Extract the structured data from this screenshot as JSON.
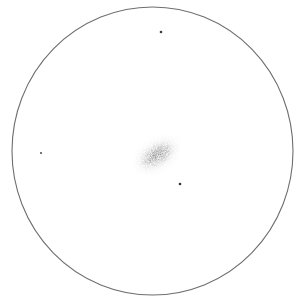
{
  "canvas": {
    "width": 299,
    "height": 301,
    "background": "#ffffff"
  },
  "field_of_view": {
    "cx": 152.5,
    "cy": 151,
    "rx": 140.5,
    "ry": 144,
    "stroke": "#6e6e6e",
    "stroke_width": 1.1
  },
  "galaxy": {
    "cx": 157,
    "cy": 155,
    "halo": {
      "rx": 20,
      "ry": 10.5,
      "color": "#9a9a9a"
    },
    "body": {
      "rx": 14,
      "ry": 7,
      "color": "#6f6f6f"
    },
    "core": {
      "rx": 6,
      "ry": 3.2,
      "color": "#5a5a5a"
    },
    "rotation_deg": -32
  },
  "stars": [
    {
      "name": "star-top",
      "cx": 161,
      "cy": 32,
      "r": 1.3,
      "color": "#3a3a3a"
    },
    {
      "name": "star-left",
      "cx": 41,
      "cy": 153,
      "r": 1.1,
      "color": "#555555"
    },
    {
      "name": "star-lower-right",
      "cx": 180,
      "cy": 184,
      "r": 1.3,
      "color": "#333333"
    }
  ]
}
